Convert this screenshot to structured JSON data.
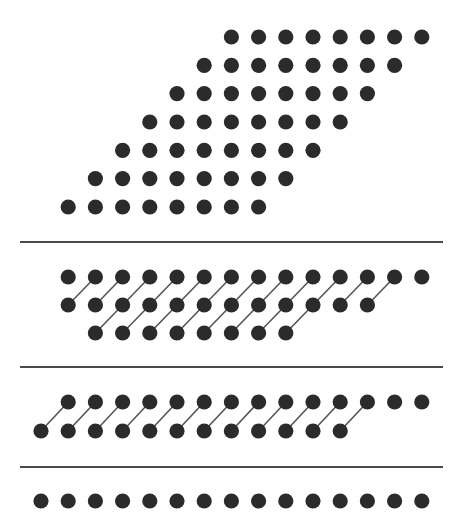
{
  "diagram": {
    "title": "",
    "colors": {
      "dot": "#2b2b2b",
      "link": "#555555",
      "divider": "#4a4a4a",
      "background": "#ffffff"
    },
    "sections": [
      {
        "name": "parallelogram-array",
        "rows": [
          {
            "start_col": 7,
            "count": 8
          },
          {
            "start_col": 6,
            "count": 8
          },
          {
            "start_col": 5,
            "count": 8
          },
          {
            "start_col": 4,
            "count": 8
          },
          {
            "start_col": 3,
            "count": 8
          },
          {
            "start_col": 2,
            "count": 8
          },
          {
            "start_col": 1,
            "count": 8
          }
        ],
        "links": []
      },
      {
        "name": "three-row-merge",
        "rows": [
          {
            "start_col": 1,
            "count": 14
          },
          {
            "start_col": 1,
            "count": 12
          },
          {
            "start_col": 2,
            "count": 8
          }
        ],
        "links": [
          {
            "from_row": 1,
            "to_row": 0,
            "from_cols": [
              1,
              12
            ],
            "col_shift": 1
          },
          {
            "from_row": 2,
            "to_row": 1,
            "from_cols": [
              2,
              9
            ],
            "col_shift": 1
          }
        ]
      },
      {
        "name": "two-row-merge",
        "rows": [
          {
            "start_col": 1,
            "count": 14
          },
          {
            "start_col": 0,
            "count": 12
          }
        ],
        "links": [
          {
            "from_row": 1,
            "to_row": 0,
            "from_cols": [
              0,
              11
            ],
            "col_shift": 1
          }
        ]
      },
      {
        "name": "single-row-result",
        "rows": [
          {
            "start_col": 0,
            "count": 15
          }
        ],
        "links": []
      }
    ],
    "dividers": 3
  }
}
